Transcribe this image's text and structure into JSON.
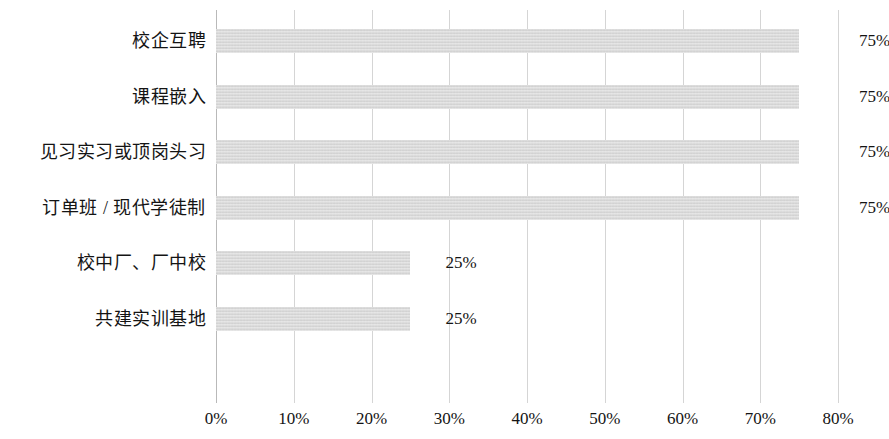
{
  "chart_data": {
    "type": "bar",
    "orientation": "horizontal",
    "title": "",
    "subtitle": "",
    "xlabel": "",
    "ylabel": "",
    "xlim": [
      0,
      80
    ],
    "ylim": null,
    "grid": true,
    "grid_axis": "x",
    "legend": false,
    "legend_position": "none",
    "categories": [
      "校企互聘",
      "课程嵌入",
      "见习实习或顶岗头习",
      "订单班 / 现代学徒制",
      "校中厂、厂中校",
      "共建实训基地"
    ],
    "values": [
      75,
      75,
      75,
      75,
      25,
      25
    ],
    "value_labels": [
      "75%",
      "75%",
      "75%",
      "75%",
      "25%",
      "25%"
    ],
    "xticks": [
      0,
      10,
      20,
      30,
      40,
      50,
      60,
      70,
      80
    ],
    "xtick_labels": [
      "0%",
      "10%",
      "20%",
      "30%",
      "40%",
      "50%",
      "60%",
      "70%",
      "80%"
    ],
    "bar_color": "#d7d7d7",
    "gridline_color": "#d5d5d5",
    "axis_color": "#b9b9b9",
    "text_color": "#141414",
    "background_color": "#ffffff"
  }
}
